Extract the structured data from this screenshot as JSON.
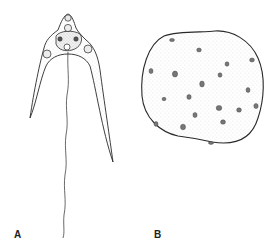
{
  "figure": {
    "panels": [
      {
        "id": "A",
        "label": "A",
        "subject": "flagellated organism with curved arms and nuclei"
      },
      {
        "id": "B",
        "label": "B",
        "subject": "rounded multinucleate cell mass"
      }
    ],
    "colors": {
      "ink": "#2a2a2a",
      "stipple": "#9a9a9a",
      "background": "#ffffff"
    }
  }
}
